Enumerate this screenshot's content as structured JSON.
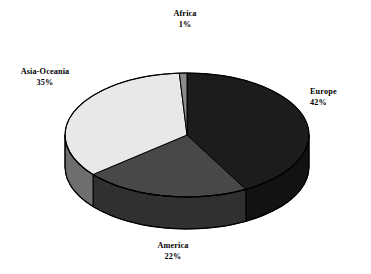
{
  "chart_data": {
    "type": "pie",
    "title": "",
    "subtitle": "",
    "xlabel": "",
    "ylabel": "",
    "legend_position": "none",
    "grid": false,
    "three_d": true,
    "value_unit": "%",
    "categories": [
      "Europe",
      "Asia-Oceania",
      "America",
      "Africa"
    ],
    "values": [
      42,
      35,
      22,
      1
    ],
    "slices": [
      {
        "label": "Europe",
        "value": 42,
        "percent_text": "42%",
        "color": "#1c1c1c",
        "side_color": "#121212",
        "start_angle_deg": 0,
        "end_angle_deg": 151.2
      },
      {
        "label": "America",
        "value": 22,
        "percent_text": "22%",
        "color": "#484848",
        "side_color": "#303030",
        "start_angle_deg": 151.2,
        "end_angle_deg": 230.4
      },
      {
        "label": "Asia-Oceania",
        "value": 35,
        "percent_text": "35%",
        "color": "#e8e8e8",
        "side_color": "#6e6e6e",
        "start_angle_deg": 230.4,
        "end_angle_deg": 356.4
      },
      {
        "label": "Africa",
        "value": 1,
        "percent_text": "1%",
        "color": "#8a8a8a",
        "side_color": "#5a5a5a",
        "start_angle_deg": 356.4,
        "end_angle_deg": 360
      }
    ],
    "outline_color": "#000000",
    "background_color": "#ffffff"
  },
  "labels": {
    "africa": {
      "name": "Africa",
      "percent": "1%"
    },
    "europe": {
      "name": "Europe",
      "percent": "42%"
    },
    "asia": {
      "name": "Asia-Oceania",
      "percent": "35%"
    },
    "america": {
      "name": "America",
      "percent": "22%"
    }
  }
}
